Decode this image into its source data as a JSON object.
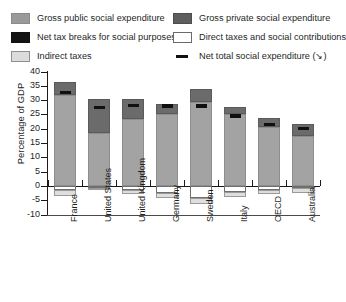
{
  "legend": {
    "entries": [
      {
        "key": "public",
        "label": "Gross public social expenditure",
        "color": "#9a9a9a",
        "marker": "swatch"
      },
      {
        "key": "private",
        "label": "Gross private social expenditure",
        "color": "#5e5e5e",
        "marker": "swatch"
      },
      {
        "key": "taxbreak",
        "label": "Net tax breaks for social purposes",
        "color": "#141414",
        "marker": "swatch"
      },
      {
        "key": "direct",
        "label": "Direct taxes and social contributions",
        "color": "#ffffff",
        "marker": "swatch"
      },
      {
        "key": "indirect",
        "label": "Indirect taxes",
        "color": "#dcdcdc",
        "marker": "swatch"
      },
      {
        "key": "nettotal",
        "label": "Net total social expenditure (↘)",
        "color": "#111111",
        "marker": "dash"
      }
    ]
  },
  "chart_data": {
    "type": "bar",
    "stacked": true,
    "title": "",
    "xlabel": "",
    "ylabel": "Percentage of GDP",
    "ylim": [
      -10,
      40
    ],
    "yticks": [
      -10,
      -5,
      0,
      5,
      10,
      15,
      20,
      25,
      30,
      35,
      40
    ],
    "ytick_labels": [
      "-10",
      "-5",
      "0",
      "5",
      "10",
      "15",
      "20",
      "25",
      "30",
      "35",
      "40"
    ],
    "grid": false,
    "legend_position": "top",
    "categories": [
      "France",
      "United States",
      "United Kingdom",
      "Germany",
      "Sweden",
      "Italy",
      "OECD",
      "Australia"
    ],
    "series": [
      {
        "name": "Gross public social expenditure",
        "key": "public",
        "values": [
          31.7,
          18.4,
          23.5,
          25.0,
          29.4,
          25.0,
          20.6,
          17.5
        ]
      },
      {
        "name": "Gross private social expenditure",
        "key": "private",
        "values": [
          4.5,
          12.1,
          7.0,
          3.8,
          4.4,
          2.7,
          3.0,
          4.0
        ]
      },
      {
        "name": "Direct taxes and social contributions",
        "key": "direct",
        "values": [
          -1.6,
          -0.6,
          -1.3,
          -2.4,
          -4.3,
          -2.2,
          -1.4,
          -0.8
        ]
      },
      {
        "name": "Indirect taxes",
        "key": "indirect",
        "values": [
          -2.0,
          -0.8,
          -1.7,
          -1.8,
          -2.2,
          -1.6,
          -1.5,
          -1.7
        ]
      }
    ],
    "net_total": {
      "name": "Net total social expenditure",
      "values": [
        32.7,
        27.5,
        28.1,
        28.0,
        28.0,
        24.4,
        21.5,
        20.0
      ]
    }
  }
}
